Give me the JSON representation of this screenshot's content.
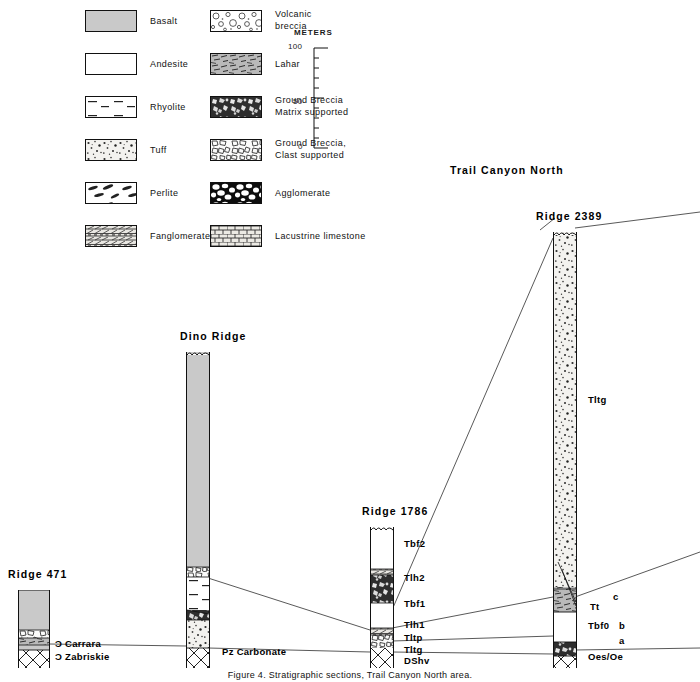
{
  "figure": {
    "kind": "stratigraphic-correlation-diagram",
    "caption": "Figure 4. Stratigraphic sections, Trail Canyon North area.",
    "region_title": "Trail Canyon North"
  },
  "legend": {
    "column_left": [
      {
        "key": "basalt",
        "label": "Basalt",
        "pattern": "solid-gray"
      },
      {
        "key": "andesite",
        "label": "Andesite",
        "pattern": "blank-white"
      },
      {
        "key": "rhyolite",
        "label": "Rhyolite",
        "pattern": "dashes"
      },
      {
        "key": "tuff",
        "label": "Tuff",
        "pattern": "fine-speckle"
      },
      {
        "key": "perlite",
        "label": "Perlite",
        "pattern": "lens-blobs"
      },
      {
        "key": "fanglomerate",
        "label": "Fanglomerate",
        "pattern": "fanglomerate-bands"
      }
    ],
    "column_right": [
      {
        "key": "volcanic-breccia",
        "label": "Volcanic breccia",
        "label_line1": "Volcanic",
        "label_line2": "breccia",
        "pattern": "open-clasts"
      },
      {
        "key": "lahar",
        "label": "Lahar",
        "label_line1": "Lahar",
        "label_line2": "",
        "pattern": "streaky"
      },
      {
        "key": "ground-breccia-matrix",
        "label": "Ground Breccia Matrix supported",
        "label_line1": "Ground Breccia",
        "label_line2": "Matrix supported",
        "pattern": "dark-matrix-breccia"
      },
      {
        "key": "ground-breccia-clast",
        "label": "Ground Breccia, Clast supported",
        "label_line1": "Ground Breccia,",
        "label_line2": "Clast supported",
        "pattern": "light-clast-breccia"
      },
      {
        "key": "agglomerate",
        "label": "Agglomerate",
        "label_line1": "Agglomerate",
        "label_line2": "",
        "pattern": "black-agglomerate"
      },
      {
        "key": "lacustrine-limestone",
        "label": "Lacustrine limestone",
        "label_line1": "Lacustrine limestone",
        "label_line2": "",
        "pattern": "brick"
      }
    ]
  },
  "scale": {
    "title": "METERS",
    "ticks": [
      {
        "value": 100,
        "label": "100",
        "major": true
      },
      {
        "value": 90,
        "label": "",
        "major": false
      },
      {
        "value": 80,
        "label": "",
        "major": false
      },
      {
        "value": 70,
        "label": "",
        "major": false
      },
      {
        "value": 60,
        "label": "",
        "major": false
      },
      {
        "value": 50,
        "label": "50",
        "major": true
      },
      {
        "value": 40,
        "label": "",
        "major": false
      },
      {
        "value": 30,
        "label": "",
        "major": false
      },
      {
        "value": 20,
        "label": "",
        "major": false
      },
      {
        "value": 10,
        "label": "",
        "major": false
      },
      {
        "value": 0,
        "label": "0",
        "major": true
      }
    ],
    "min": 0,
    "max": 100,
    "units": "meters"
  },
  "sections": [
    {
      "id": "ridge-471",
      "title": "Ridge 471",
      "basement_labels": [
        "Ɔ Carrara",
        "Ɔ Zabriskie"
      ],
      "basement_label_1": "Ɔ Carrara",
      "basement_label_2": "Ɔ Zabriskie",
      "units": [
        {
          "name": "",
          "pattern": "solid-gray",
          "thickness_px": 40
        },
        {
          "name": "",
          "pattern": "light-clast-breccia",
          "thickness_px": 8
        },
        {
          "name": "",
          "pattern": "streaky",
          "thickness_px": 7
        },
        {
          "name": "",
          "pattern": "solid-gray",
          "thickness_px": 5
        },
        {
          "name": "",
          "pattern": "carbonate-hatch",
          "thickness_px": 18
        }
      ]
    },
    {
      "id": "dino-ridge",
      "title": "Dino Ridge",
      "basement_labels": [
        "Pz Carbonate"
      ],
      "basement_label_1": "Pz Carbonate",
      "units": [
        {
          "name": "",
          "pattern": "solid-gray",
          "thickness_px": 215
        },
        {
          "name": "",
          "pattern": "light-clast-breccia",
          "thickness_px": 10
        },
        {
          "name": "",
          "pattern": "dashes",
          "thickness_px": 33
        },
        {
          "name": "",
          "pattern": "dark-matrix-breccia",
          "thickness_px": 10
        },
        {
          "name": "",
          "pattern": "fine-speckle",
          "thickness_px": 60
        },
        {
          "name": "",
          "pattern": "carbonate-hatch",
          "thickness_px": 20
        }
      ]
    },
    {
      "id": "ridge-1786",
      "title": "Ridge 1786",
      "basement_labels": [
        "DShv"
      ],
      "basement_label_1": "DShv",
      "units": [
        {
          "name": "Tbf2",
          "pattern": "blank-white",
          "thickness_px": 42
        },
        {
          "name": "",
          "pattern": "fanglomerate-bands",
          "thickness_px": 6
        },
        {
          "name": "Tlh2",
          "pattern": "dark-matrix-breccia",
          "thickness_px": 28
        },
        {
          "name": "Tbf1",
          "pattern": "blank-white",
          "thickness_px": 25
        },
        {
          "name": "Tlh1",
          "pattern": "fanglomerate-bands",
          "thickness_px": 7
        },
        {
          "name": "Tltp",
          "pattern": "light-clast-breccia",
          "thickness_px": 22
        },
        {
          "name": "Tltg",
          "pattern": "fine-speckle",
          "thickness_px": 10
        },
        {
          "name": "",
          "pattern": "brick",
          "thickness_px": 5
        },
        {
          "name": "DShv",
          "pattern": "carbonate-hatch",
          "thickness_px": 20
        }
      ]
    },
    {
      "id": "ridge-2389",
      "title": "Ridge 2389",
      "basement_labels": [
        "Oes/Oe"
      ],
      "basement_label_1": "Oes/Oe",
      "units": [
        {
          "name": "Tltg",
          "pattern": "fine-speckle",
          "thickness_px": 355
        },
        {
          "name": "Tt",
          "pattern": "streaky",
          "thickness_px": 18
        },
        {
          "name": "Tbf0",
          "pattern": "blank-white",
          "thickness_px": 30
        },
        {
          "name": "",
          "pattern": "dark-matrix-breccia",
          "thickness_px": 14
        },
        {
          "name": "Oes/Oe",
          "pattern": "carbonate-hatch",
          "thickness_px": 22
        }
      ],
      "marginal_labels": [
        "c",
        "b",
        "a"
      ],
      "marginal_label_c": "c",
      "marginal_label_b": "b",
      "marginal_label_a": "a"
    }
  ],
  "colors": {
    "ink": "#111111",
    "basalt_gray": "#c9c9c9",
    "lahar_gray": "#b8b8b8",
    "background": "#ffffff"
  }
}
